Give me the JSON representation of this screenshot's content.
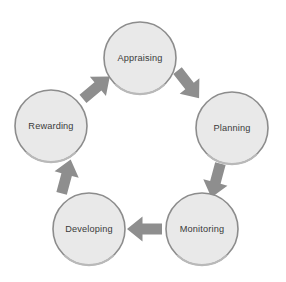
{
  "diagram": {
    "type": "circular-process",
    "background_color": "#ffffff",
    "node_fill_color": "#e9e9e9",
    "node_border_color": "#8c8c8c",
    "node_text_color": "#3a3a3a",
    "arrow_color": "#8e8e8e",
    "nodes": [
      {
        "id": "appraising",
        "label": "Appraising",
        "cx": 140,
        "cy": 58,
        "r": 36,
        "order": 1
      },
      {
        "id": "planning",
        "label": "Planning",
        "cx": 232,
        "cy": 128,
        "r": 36,
        "order": 2
      },
      {
        "id": "monitoring",
        "label": "Monitoring",
        "cx": 202,
        "cy": 229,
        "r": 36,
        "order": 3
      },
      {
        "id": "developing",
        "label": "Developing",
        "cx": 89,
        "cy": 229,
        "r": 36,
        "order": 4
      },
      {
        "id": "rewarding",
        "label": "Rewarding",
        "cx": 51,
        "cy": 126,
        "r": 36,
        "order": 5
      }
    ],
    "arrows": [
      {
        "id": "appraising-to-planning",
        "from": "appraising",
        "to": "planning",
        "direction": "down-right",
        "rotation": 52,
        "cx": 188,
        "cy": 84
      },
      {
        "id": "planning-to-monitoring",
        "from": "planning",
        "to": "monitoring",
        "direction": "down",
        "rotation": 105,
        "cx": 216,
        "cy": 180
      },
      {
        "id": "monitoring-to-developing",
        "from": "monitoring",
        "to": "developing",
        "direction": "left",
        "rotation": 180,
        "cx": 145,
        "cy": 229
      },
      {
        "id": "developing-to-rewarding",
        "from": "developing",
        "to": "rewarding",
        "direction": "up-left",
        "rotation": -75,
        "cx": 66,
        "cy": 177
      },
      {
        "id": "rewarding-to-appraising",
        "from": "rewarding",
        "to": "appraising",
        "direction": "up-right",
        "rotation": -40,
        "cx": 96,
        "cy": 88
      }
    ]
  }
}
